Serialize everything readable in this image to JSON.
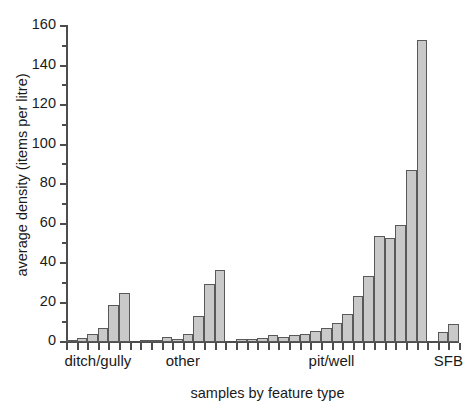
{
  "chart_data": {
    "type": "bar",
    "title": "",
    "xlabel": "samples by feature type",
    "ylabel": "average density (items per litre)",
    "ylim": [
      0,
      160
    ],
    "ytick_values": [
      0,
      20,
      40,
      60,
      80,
      100,
      120,
      140,
      160
    ],
    "ytick_labels": [
      "0",
      "20",
      "40",
      "60",
      "80",
      "100",
      "120",
      "140",
      "160"
    ],
    "yminor_values": [
      10,
      30,
      50,
      70,
      90,
      110,
      130,
      150
    ],
    "grid": false,
    "legend": null,
    "group_labels": [
      "ditch/gully",
      "other",
      "pit/well",
      "SFB"
    ],
    "groups": [
      {
        "name": "ditch/gully",
        "values": [
          1.2,
          2.2,
          4.0,
          7.2,
          18.6,
          24.8
        ]
      },
      {
        "name": "other",
        "values": [
          0.3,
          0.4,
          2.3,
          1.6,
          4.2,
          13.2,
          29.6,
          36.4
        ]
      },
      {
        "name": "pit/well",
        "values": [
          1.5,
          1.6,
          2.2,
          3.6,
          2.3,
          3.6,
          4.0,
          5.5,
          7.0,
          9.8,
          14.2,
          23.5,
          33.5,
          53.5,
          52.8,
          59.0,
          87.0,
          153.0
        ]
      },
      {
        "name": "SFB",
        "values": [
          5.3,
          9.0
        ]
      }
    ],
    "gaps_after_group": [
      1,
      1,
      1
    ],
    "colors": {
      "bar_fill": "#c9c9c9",
      "bar_edge": "#595959",
      "axis": "#4d4d4d",
      "text": "#1a1a1a",
      "background": "#ffffff"
    }
  }
}
